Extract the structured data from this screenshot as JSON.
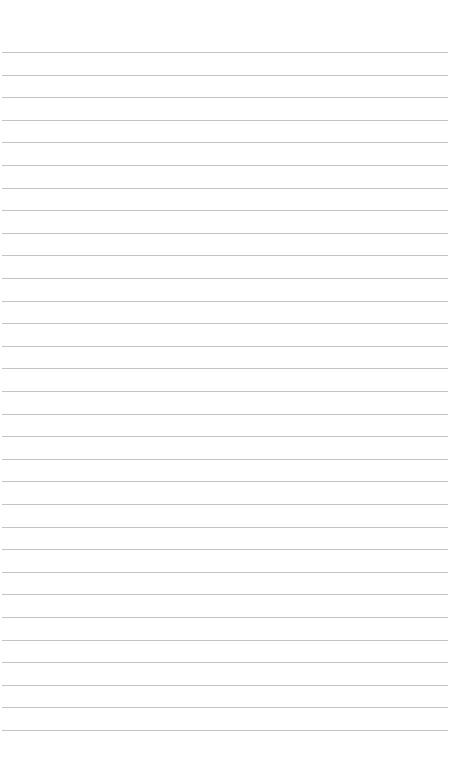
{
  "page": {
    "type": "lined-paper",
    "background_color": "#ffffff",
    "line_color": "#c4c4c4",
    "line_count": 31,
    "first_line_y": 52,
    "line_spacing": 22.6,
    "line_left": 2,
    "line_width": 446
  }
}
